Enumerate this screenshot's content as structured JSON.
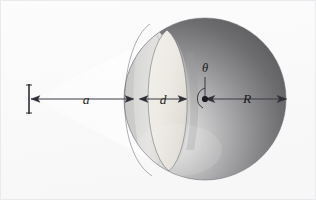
{
  "figure": {
    "kind": "physics-diagram",
    "canvas": {
      "width": 316,
      "height": 200
    },
    "background_color": "#fbfbfc",
    "ink_color": "#2e2e36",
    "labels": {
      "distance_a": "a",
      "depth_d": "d",
      "radius_R": "R",
      "angle_theta": "θ"
    },
    "elements": {
      "source_marker_name": "point-source",
      "center_dot_name": "sphere-center",
      "beam_name": "light-cone"
    },
    "sphere": {
      "center_x": 205,
      "center_y": 99,
      "radius": 81,
      "fill_light": "#d8d8d8",
      "fill_dark": "#5d5d5f",
      "cut_face_fill": "#eceae4"
    },
    "dimensions": {
      "a_start_x": 29,
      "a_end_x": 135,
      "d_start_x": 138,
      "d_end_x": 188,
      "R_start_x": 206,
      "R_end_x": 287,
      "axis_y": 99
    }
  }
}
